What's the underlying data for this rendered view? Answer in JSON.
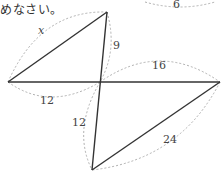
{
  "caption": "めなさい。",
  "diagram": {
    "type": "geometry-figure",
    "points": {
      "A": [
        8,
        82
      ],
      "B": [
        107,
        12
      ],
      "C": [
        92,
        170
      ],
      "D": [
        220,
        82
      ],
      "O": [
        100,
        82
      ]
    },
    "segments": [
      [
        "A",
        "B"
      ],
      [
        "B",
        "C"
      ],
      [
        "A",
        "D"
      ],
      [
        "D",
        "C"
      ]
    ],
    "labels": {
      "AB": "x",
      "BO": "9",
      "AO": "12",
      "OD": "16",
      "OC": "12",
      "DC": "24",
      "top_partial": "6"
    },
    "colors": {
      "line": "#333333",
      "arc": "#b0b0b0",
      "text": "#444444"
    }
  }
}
